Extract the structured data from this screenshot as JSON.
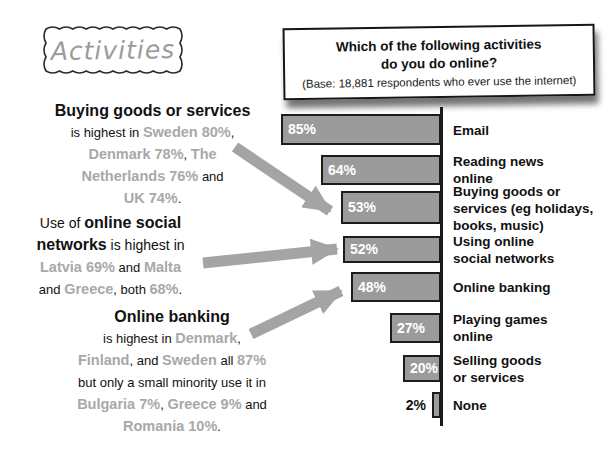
{
  "activities_label": "Activities",
  "question_box": {
    "title_line1": "Which of the following activities",
    "title_line2": "do you do online?",
    "base_note": "(Base: 18,881 respondents who ever use the internet)"
  },
  "chart_data": {
    "type": "bar",
    "orientation": "horizontal-right-aligned",
    "title": "Which of the following activities do you do online?",
    "subtitle": "(Base: 18,881 respondents who ever use the internet)",
    "categories": [
      "Email",
      "Reading news online",
      "Buying goods or services (eg holidays, books, music)",
      "Using online social networks",
      "Online banking",
      "Playing games online",
      "Selling goods or services",
      "None"
    ],
    "category_lines": [
      [
        "Email"
      ],
      [
        "Reading news",
        "online"
      ],
      [
        "Buying goods or",
        "services (eg holidays,",
        "books, music)"
      ],
      [
        "Using online",
        "social networks"
      ],
      [
        "Online banking"
      ],
      [
        "Playing games",
        "online"
      ],
      [
        "Selling goods",
        "or services"
      ],
      [
        "None"
      ]
    ],
    "values": [
      85,
      64,
      53,
      52,
      48,
      27,
      20,
      2
    ],
    "value_labels": [
      "85%",
      "64%",
      "53%",
      "52%",
      "48%",
      "27%",
      "20%",
      "2%"
    ],
    "xlim": [
      0,
      100
    ],
    "grid": false,
    "legend": "none",
    "value_label_position": "inside-left (outside for None)"
  },
  "annotations": [
    {
      "id": "note-buying-goods",
      "points_to": "Buying goods or services 53% bar",
      "lines": [
        [
          {
            "t": "Buying goods or services",
            "s": "h"
          }
        ],
        [
          {
            "t": "is highest in ",
            "s": "p"
          },
          {
            "t": "Sweden 80%",
            "s": "g"
          },
          {
            "t": ",",
            "s": "p"
          }
        ],
        [
          {
            "t": "Denmark 78%",
            "s": "g"
          },
          {
            "t": ", ",
            "s": "p"
          },
          {
            "t": "The",
            "s": "g"
          }
        ],
        [
          {
            "t": "Netherlands 76%",
            "s": "g"
          },
          {
            "t": " and",
            "s": "p"
          }
        ],
        [
          {
            "t": "UK 74%",
            "s": "g"
          },
          {
            "t": ".",
            "s": "p"
          }
        ]
      ]
    },
    {
      "id": "note-social-networks",
      "points_to": "Using online social networks 52% bar",
      "lines": [
        [
          {
            "t": "Use of ",
            "s": "ph"
          },
          {
            "t": "online social",
            "s": "h"
          }
        ],
        [
          {
            "t": "networks",
            "s": "h"
          },
          {
            "t": " is highest in",
            "s": "ph"
          }
        ],
        [
          {
            "t": "Latvia 69%",
            "s": "g"
          },
          {
            "t": " and ",
            "s": "p"
          },
          {
            "t": "Malta",
            "s": "g"
          }
        ],
        [
          {
            "t": "and ",
            "s": "p"
          },
          {
            "t": "Greece",
            "s": "g"
          },
          {
            "t": ", both ",
            "s": "p"
          },
          {
            "t": "68%",
            "s": "g"
          },
          {
            "t": ".",
            "s": "p"
          }
        ]
      ]
    },
    {
      "id": "note-online-banking",
      "points_to": "Online banking 48% bar",
      "lines": [
        [
          {
            "t": "Online banking",
            "s": "h"
          }
        ],
        [
          {
            "t": "is highest in ",
            "s": "p"
          },
          {
            "t": "Denmark",
            "s": "g"
          },
          {
            "t": ",",
            "s": "p"
          }
        ],
        [
          {
            "t": "Finland",
            "s": "g"
          },
          {
            "t": ", and ",
            "s": "p"
          },
          {
            "t": "Sweden",
            "s": "g"
          },
          {
            "t": " all ",
            "s": "p"
          },
          {
            "t": "87%",
            "s": "g"
          }
        ],
        [
          {
            "t": "but only a small minority use it in",
            "s": "p"
          }
        ],
        [
          {
            "t": "Bulgaria 7%",
            "s": "g"
          },
          {
            "t": ", ",
            "s": "p"
          },
          {
            "t": "Greece 9%",
            "s": "g"
          },
          {
            "t": " and",
            "s": "p"
          }
        ],
        [
          {
            "t": "Romania 10%",
            "s": "g"
          },
          {
            "t": ".",
            "s": "p"
          }
        ]
      ]
    }
  ],
  "arrows": [
    {
      "from": "note-buying-goods",
      "to": "53% bar"
    },
    {
      "from": "note-social-networks",
      "to": "52% bar"
    },
    {
      "from": "note-online-banking",
      "to": "48% bar"
    }
  ],
  "colors": {
    "bar_fill": "#9b9b9b",
    "bar_border": "#1c1c1c",
    "bar_value_text": "#ffffff",
    "highlight_text": "#a8a8a8",
    "arrow": "#a4a4a4",
    "text": "#111111",
    "background": "#ffffff"
  }
}
